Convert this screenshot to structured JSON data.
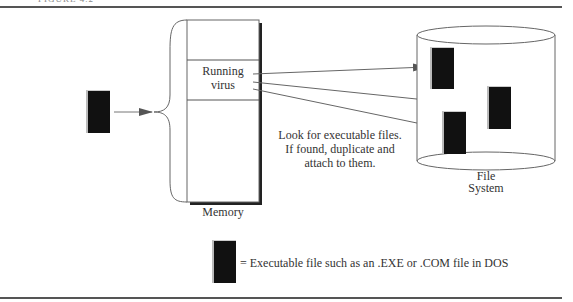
{
  "figure": {
    "caption_fragment": "FIGURE 4.2"
  },
  "memory": {
    "label": "Memory",
    "running_label_line1": "Running",
    "running_label_line2": "virus"
  },
  "annotation": {
    "line1": "Look for executable files.",
    "line2": "If found, duplicate and",
    "line3": "attach to them."
  },
  "file_system": {
    "label_line1": "File",
    "label_line2": "System"
  },
  "legend": {
    "text": "= Executable file such as an .EXE or .COM file in DOS"
  },
  "colors": {
    "file_fill": "#111111",
    "line": "#555555",
    "arrow": "#555555"
  }
}
